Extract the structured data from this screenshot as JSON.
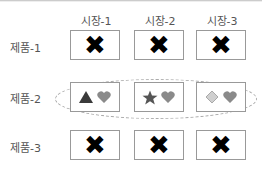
{
  "columns": [
    "시장-1",
    "시장-2",
    "시장-3"
  ],
  "rows": [
    {
      "label": "제품-1",
      "cells": [
        "x-mark",
        "x-mark",
        "x-mark"
      ]
    },
    {
      "label": "제품-2",
      "cells": [
        "triangle+heart",
        "star+heart",
        "diamond+heart"
      ]
    },
    {
      "label": "제품-3",
      "cells": [
        "x-mark",
        "x-mark",
        "x-mark"
      ]
    }
  ],
  "glyphs": {
    "x": "✖"
  },
  "colors": {
    "dark_shape": "#3a3a3a",
    "heart": "#8a8a8a",
    "diamond": "#cfcfcf",
    "border": "#999999"
  }
}
